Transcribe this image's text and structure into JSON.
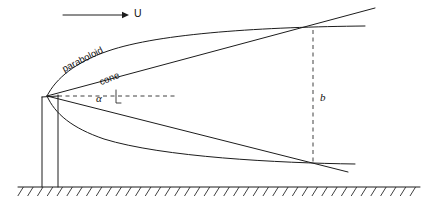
{
  "figure": {
    "background_color": "#ffffff",
    "line_color": "#1c1c1c",
    "labels": {
      "flow_arrow": "U",
      "paraboloid": "paraboloid",
      "cone": "cone",
      "angle": "α",
      "width": "b"
    },
    "geometry": {
      "apex": {
        "x": 47,
        "y": 96
      },
      "post": {
        "left_x": 42,
        "right_x": 58,
        "top_y": 97,
        "bottom_y": 187
      },
      "ground_line": {
        "x1": 18,
        "x2": 420,
        "y": 187
      },
      "hatch_count": 41,
      "hatch_length": 9,
      "flow_arrow": {
        "x1": 63,
        "x2": 126,
        "y": 15
      },
      "flow_label_pos": {
        "x": 134,
        "y": 14
      },
      "dashed_vertical": {
        "x": 313,
        "y1": 30,
        "y2": 162
      },
      "b_label_pos": {
        "x": 321,
        "y": 98
      },
      "dashed_horizontal": {
        "x1": 58,
        "x2": 175,
        "y": 96
      },
      "angle_label_pos": {
        "x": 98,
        "y": 99
      },
      "angle_tick": {
        "x": 116,
        "y1": 91,
        "y2": 104
      },
      "paraboloid_label_pos": {
        "x": 63,
        "y": 70
      },
      "paraboloid_label_rotation": -27,
      "cone_label_pos": {
        "x": 100,
        "y": 83
      },
      "cone_label_rotation": -22,
      "upper_cone_line": {
        "x1": 47,
        "y1": 96,
        "x2": 375,
        "y2": 8
      },
      "upper_paraboloid_end": {
        "x": 365,
        "y": 26
      },
      "lower_cone_line": {
        "x1": 47,
        "y1": 96,
        "x2": 348,
        "y2": 172
      },
      "lower_paraboloid_end": {
        "x": 355,
        "y": 164
      },
      "top_crossing": {
        "x": 313,
        "y": 31
      },
      "bottom_crossing": {
        "x": 313,
        "y": 161
      }
    }
  }
}
